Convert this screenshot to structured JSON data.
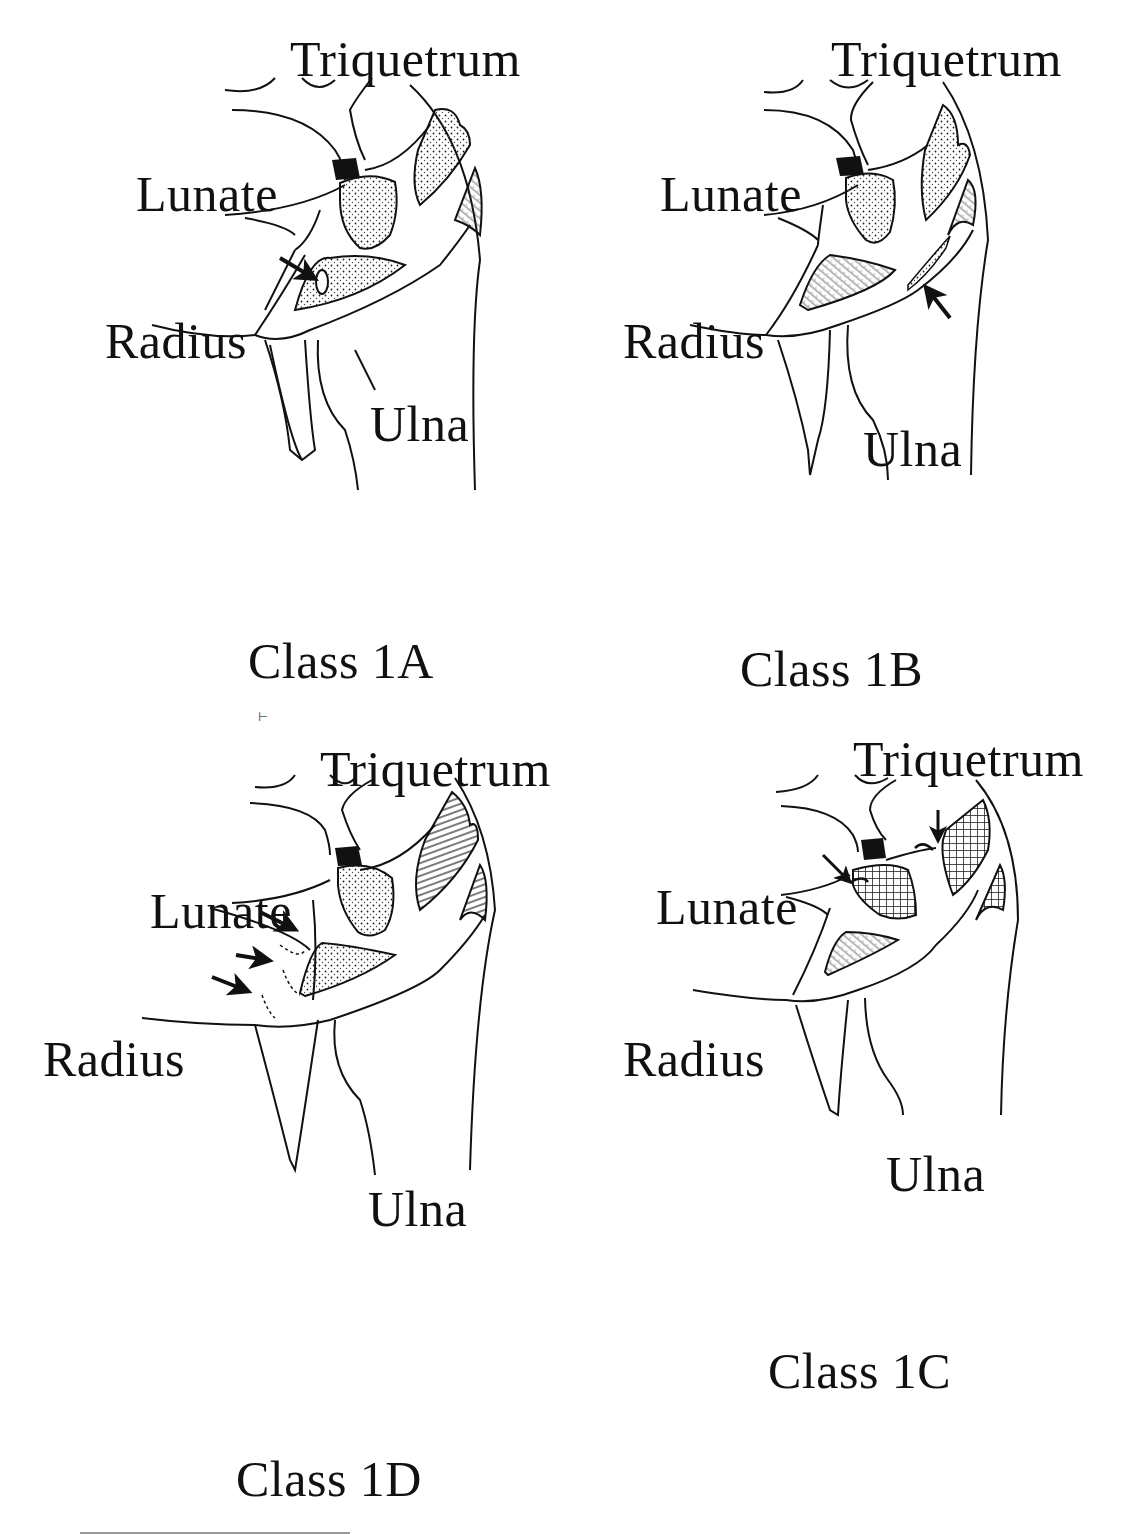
{
  "figure": {
    "panels": [
      {
        "id": "1A",
        "caption": "Class 1A",
        "labels": {
          "triquetrum": "Triquetrum",
          "lunate": "Lunate",
          "radius": "Radius",
          "ulna": "Ulna"
        },
        "arrows": 1,
        "lesion": "central perforation of the TFCC articular disc"
      },
      {
        "id": "1B",
        "caption": "Class 1B",
        "labels": {
          "triquetrum": "Triquetrum",
          "lunate": "Lunate",
          "radius": "Radius",
          "ulna": "Ulna"
        },
        "arrows": 1,
        "lesion": "ulnar avulsion"
      },
      {
        "id": "1D",
        "caption": "Class 1D",
        "labels": {
          "triquetrum": "Triquetrum",
          "lunate": "Lunate",
          "radius": "Radius",
          "ulna": "Ulna"
        },
        "arrows": 3,
        "lesion": "radial avulsion"
      },
      {
        "id": "1C",
        "caption": "Class 1C",
        "labels": {
          "triquetrum": "Triquetrum",
          "lunate": "Lunate",
          "radius": "Radius",
          "ulna": "Ulna"
        },
        "arrows": 2,
        "lesion": "distal avulsion"
      }
    ],
    "colors": {
      "ink": "#111111",
      "background": "#ffffff",
      "rule": "#999999"
    }
  }
}
